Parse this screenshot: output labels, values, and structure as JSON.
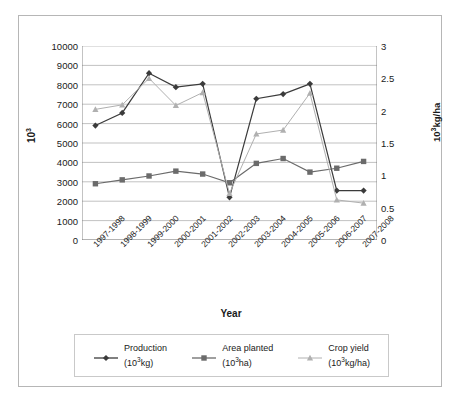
{
  "chart_data": {
    "type": "line",
    "title": "",
    "xlabel": "Year",
    "ylabel": "10³",
    "y2label": "10³kg/ha",
    "ylim": [
      0,
      10000
    ],
    "y2lim": [
      0,
      3
    ],
    "grid": true,
    "legend_position": "bottom",
    "categories": [
      "1997-1998",
      "1998-1999",
      "1999-2000",
      "2000-2001",
      "2001-2002",
      "2002-2003",
      "2003-2004",
      "2004-2005",
      "2005-2006",
      "2006-2007",
      "2007-2008"
    ],
    "yticks": [
      "0",
      "1000",
      "2000",
      "3000",
      "4000",
      "5000",
      "6000",
      "7000",
      "8000",
      "9000",
      "10000"
    ],
    "y2ticks": [
      "0",
      "0.5",
      "1",
      "1.5",
      "2",
      "2.5",
      "3"
    ],
    "series": [
      {
        "name": "Production",
        "units": "(10³kg)",
        "axis": "left",
        "marker": "diamond",
        "color": "#3b3b3b",
        "values": [
          5900,
          6550,
          8600,
          7880,
          8050,
          2200,
          7280,
          7520,
          8050,
          2550,
          2550
        ]
      },
      {
        "name": "Area planted",
        "units": "(10³ha)",
        "axis": "left",
        "marker": "square",
        "color": "#6b6b6b",
        "values": [
          2900,
          3100,
          3300,
          3550,
          3400,
          2950,
          3950,
          4200,
          3500,
          3700,
          4050
        ]
      },
      {
        "name": "Crop yield",
        "units": "(10³kg/ha)",
        "axis": "right",
        "marker": "triangle",
        "color": "#b0b0b0",
        "values": [
          2.02,
          2.09,
          2.5,
          2.08,
          2.28,
          0.72,
          1.64,
          1.7,
          2.27,
          0.62,
          0.57
        ]
      }
    ]
  },
  "legend": {
    "items": [
      {
        "label": "Production",
        "units": "(10³kg)"
      },
      {
        "label": "Area planted",
        "units": "(10³ha)"
      },
      {
        "label": "Crop yield",
        "units": "(10³kg/ha)"
      }
    ]
  },
  "axes": {
    "left_title": "10³",
    "right_title": "10³kg/ha",
    "x_title": "Year"
  }
}
